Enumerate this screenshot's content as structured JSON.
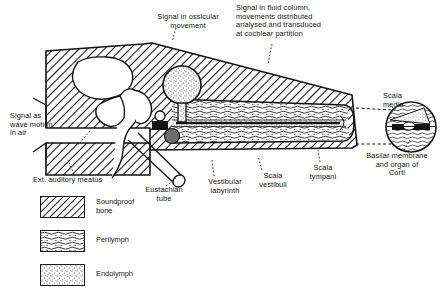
{
  "figure": {
    "background_color": "#ffffff",
    "ink_color": "#141414"
  },
  "annotations": [
    {
      "id": "ossicular",
      "text": "Signal in ossicular\nmovement",
      "points_to": "ossicular-chain"
    },
    {
      "id": "fluid-column",
      "text": "Signal in fluid column,\nmovements distributed\nanalysed and transduced\nat cochlear partition",
      "points_to": "cochlear-duct"
    },
    {
      "id": "wave-motion",
      "text": "Signal as\nwave motion\nin air",
      "points_to": "ext-auditory-meatus"
    }
  ],
  "part_labels": [
    {
      "id": "ext-auditory-meatus",
      "text": "Ext. auditory meatus"
    },
    {
      "id": "eustachian-tube",
      "text": "Eustachian\ntube"
    },
    {
      "id": "vestibular-labyrinth",
      "text": "Vestibular\nlabyrinth"
    },
    {
      "id": "scala-vestibuli",
      "text": "Scala\nvestibuli"
    },
    {
      "id": "scala-tympani",
      "text": "Scala\ntympani"
    },
    {
      "id": "scala-media",
      "text": "Scala\nmedia"
    },
    {
      "id": "basilar-membrane",
      "text": "Basilar membrane\nand organ of\nCorti"
    }
  ],
  "legend": {
    "items": [
      {
        "id": "soundproof-bone",
        "label": "Soundproof\nbone",
        "pattern": "diagonal-hatch",
        "color": "#141414"
      },
      {
        "id": "perilymph",
        "label": "Perilymph",
        "pattern": "wavy-lines",
        "color": "#141414"
      },
      {
        "id": "endolymph",
        "label": "Endolymph",
        "pattern": "stipple",
        "color": "#141414"
      }
    ]
  },
  "inset": {
    "id": "cochlear-partition-inset",
    "shape": "circle",
    "contents": [
      {
        "id": "scala-vestibuli-inset",
        "fill": "perilymph"
      },
      {
        "id": "scala-media-inset",
        "fill": "endolymph"
      },
      {
        "id": "scala-tympani-inset",
        "fill": "perilymph"
      },
      {
        "id": "basilar-membrane-inset",
        "fill": "solid-black"
      }
    ]
  }
}
